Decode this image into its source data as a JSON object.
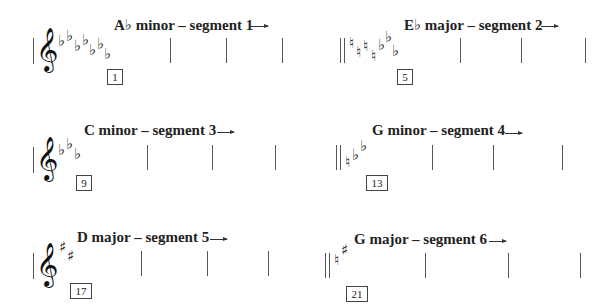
{
  "segments": [
    {
      "title": "A♭ minor – segment 1",
      "measure": "1",
      "key_signature": [
        "♭",
        "♭",
        "♭",
        "♭",
        "♭",
        "♭",
        "♭"
      ],
      "clef": "𝄞",
      "start_barline": "single"
    },
    {
      "title": "E♭ major – segment 2",
      "measure": "5",
      "key_signature": [
        "♮",
        "♮",
        "♮",
        "♮",
        "♭",
        "♭",
        "♭"
      ],
      "clef": "",
      "start_barline": "double"
    },
    {
      "title": "C minor – segment 3",
      "measure": "9",
      "key_signature": [
        "♭",
        "♭",
        "♭"
      ],
      "clef": "𝄞",
      "start_barline": "single"
    },
    {
      "title": "G minor – segment 4",
      "measure": "13",
      "key_signature": [
        "♮",
        "♭",
        "♭"
      ],
      "clef": "",
      "start_barline": "double"
    },
    {
      "title": "D major – segment 5",
      "measure": "17",
      "key_signature": [
        "♯",
        "♯"
      ],
      "clef": "𝄞",
      "start_barline": "single"
    },
    {
      "title": "G major – segment 6",
      "measure": "21",
      "key_signature": [
        "♮",
        "♯"
      ],
      "clef": "",
      "start_barline": "double"
    }
  ]
}
